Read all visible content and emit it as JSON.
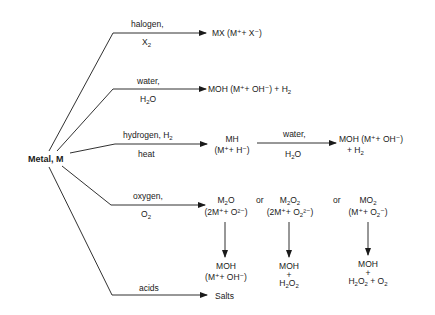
{
  "diagram": {
    "source_node": "Metal, M",
    "branches": [
      {
        "reagent_top": "halogen,",
        "reagent_bottom_main": "X",
        "reagent_bottom_sub": "2",
        "product": "MX (M⁺+ X⁻)"
      },
      {
        "reagent_top": "water,",
        "reagent_bottom_main": "H",
        "reagent_bottom_sub": "2",
        "reagent_bottom_tail": "O",
        "product_main": "MOH (M⁺+ OH⁻) + H",
        "product_sub": "2"
      },
      {
        "reagent_top_main": "hydrogen, H",
        "reagent_top_sub": "2",
        "reagent_bottom": "heat",
        "product_line1": "MH",
        "product_line2": "(M⁺+ H⁻)",
        "followup": {
          "reagent_top": "water,",
          "reagent_bottom_main": "H",
          "reagent_bottom_sub": "2",
          "reagent_bottom_tail": "O",
          "product_line1": "MOH (M⁺+ OH⁻)",
          "product_line2_main": "+ H",
          "product_line2_sub": "2"
        }
      },
      {
        "reagent_top": "oxygen,",
        "reagent_bottom_main": "O",
        "reagent_bottom_sub": "2",
        "connector": "or",
        "products": [
          {
            "formula_main": "M",
            "formula_sub": "2",
            "formula_tail": "O",
            "ions": "(2M⁺+ O²⁻)",
            "hydrolysis_line1": "MOH",
            "hydrolysis_line2": "(M⁺+ OH⁻)"
          },
          {
            "formula_main": "M",
            "formula_sub": "2",
            "formula_mid": "O",
            "formula_sub2": "2",
            "ions_main": "(2M⁺+ O",
            "ions_sub": "2",
            "ions_tail": "²⁻)",
            "hydrolysis_line1": "MOH",
            "hydrolysis_line2": "+",
            "hydrolysis_line3_main": "H",
            "hydrolysis_line3_sub": "2",
            "hydrolysis_line3_mid": "O",
            "hydrolysis_line3_sub2": "2"
          },
          {
            "formula_main": "MO",
            "formula_sub": "2",
            "ions_main": "(M⁺+ O",
            "ions_sub": "2",
            "ions_tail": "⁻)",
            "hydrolysis_line1": "MOH",
            "hydrolysis_line2": "+",
            "hydrolysis_line3_main": "H",
            "hydrolysis_line3_sub": "2",
            "hydrolysis_line3_mid": "O",
            "hydrolysis_line3_sub2": "2",
            "hydrolysis_line3_tail": " + O",
            "hydrolysis_line3_sub3": "2"
          }
        ]
      },
      {
        "reagent_top": "acids",
        "product": "Salts"
      }
    ]
  }
}
